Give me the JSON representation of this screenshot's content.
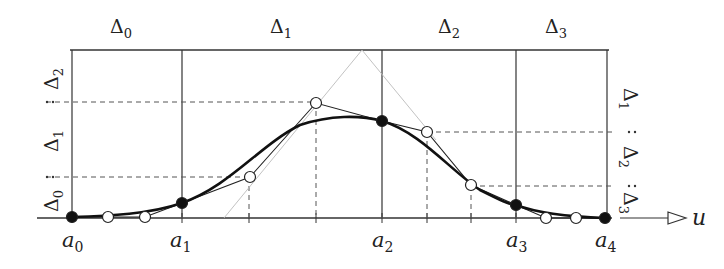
{
  "figure": {
    "top_labels": [
      {
        "text": "Δ",
        "sub": "0",
        "x": 122,
        "y": 32
      },
      {
        "text": "Δ",
        "sub": "1",
        "x": 282,
        "y": 32
      },
      {
        "text": "Δ",
        "sub": "2",
        "x": 450,
        "y": 32
      },
      {
        "text": "Δ",
        "sub": "3",
        "x": 558,
        "y": 32
      }
    ],
    "left_labels": [
      {
        "text": "Δ",
        "sub": "2",
        "x": 52,
        "y": 75
      },
      {
        "text": "Δ",
        "sub": "1",
        "x": 52,
        "y": 141
      },
      {
        "text": "Δ",
        "sub": "0",
        "x": 52,
        "y": 198
      }
    ],
    "right_labels": [
      {
        "text": "Δ",
        "sub": "1",
        "x": 628,
        "y": 103
      },
      {
        "text": "Δ",
        "sub": "2",
        "x": 628,
        "y": 160
      },
      {
        "text": "Δ",
        "sub": "3",
        "x": 628,
        "y": 205
      }
    ],
    "knots": [
      {
        "label": "a",
        "sub": "0",
        "x": 72
      },
      {
        "label": "a",
        "sub": "1",
        "x": 182
      },
      {
        "label": "a",
        "sub": "2",
        "x": 382
      },
      {
        "label": "a",
        "sub": "3",
        "x": 516
      },
      {
        "label": "a",
        "sub": "4",
        "x": 606
      }
    ],
    "axis_label": "u",
    "colors": {
      "ink": "#222222",
      "light": "#bbbbbb",
      "background": "#ffffff"
    }
  }
}
